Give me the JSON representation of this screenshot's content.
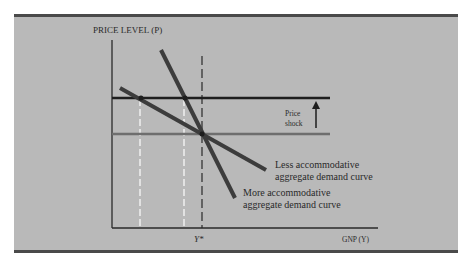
{
  "figure": {
    "y_axis_label": "PRICE LEVEL (P)",
    "x_axis_label": "GNP (Y)",
    "x_tick_label": "Y*",
    "shock_label_line1": "Price",
    "shock_label_line2": "shock",
    "less_curve_line1": "Less accommodative",
    "less_curve_line2": "aggregate demand curve",
    "more_curve_line1": "More accommodative",
    "more_curve_line2": "aggregate demand curve",
    "colors": {
      "background": "#b9b9b9",
      "lines": "#3c3c3c",
      "supply_before": "#6e6e6e",
      "guides": "#f0f0f0"
    }
  }
}
